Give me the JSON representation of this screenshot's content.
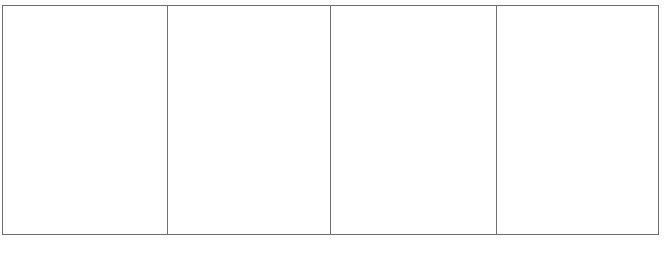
{
  "figure": {
    "panels": [
      {
        "id": "panel-1"
      },
      {
        "id": "panel-2"
      },
      {
        "id": "panel-3"
      },
      {
        "id": "panel-4"
      }
    ]
  },
  "caption": {
    "text": ""
  }
}
